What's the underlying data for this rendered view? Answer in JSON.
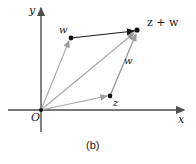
{
  "figure": {
    "caption": "(b)",
    "axes": {
      "x_label": "x",
      "y_label": "y",
      "origin_label": "O"
    },
    "points": [
      {
        "id": "w",
        "label": "w",
        "x": 71,
        "y": 38
      },
      {
        "id": "z",
        "label": "z",
        "x": 110,
        "y": 96
      },
      {
        "id": "zw",
        "label": "z + w",
        "x": 137,
        "y": 30
      },
      {
        "id": "O",
        "label": "O",
        "x": 41,
        "y": 110
      }
    ],
    "edge_labels": [
      {
        "id": "w-upper",
        "label": "w",
        "x": 61,
        "y": 27
      },
      {
        "id": "w-right",
        "label": "w",
        "x": 126,
        "y": 59
      }
    ],
    "vectors": [
      {
        "id": "O-to-w",
        "from": "O",
        "to": "w",
        "style": "gray"
      },
      {
        "id": "O-to-z",
        "from": "O",
        "to": "z",
        "style": "gray"
      },
      {
        "id": "O-to-zw",
        "from": "O",
        "to": "zw",
        "style": "gray"
      },
      {
        "id": "w-to-zw",
        "from": "w",
        "to": "zw",
        "style": "black"
      },
      {
        "id": "z-to-zw",
        "from": "z",
        "to": "zw",
        "style": "gray"
      }
    ],
    "colors": {
      "axis": "#4d4d4d",
      "gray_vector": "#a6a6a6",
      "black_vector": "#1a1a1a",
      "dot": "#111111",
      "text": "#1a1a1a",
      "background": "#ffffff"
    }
  }
}
